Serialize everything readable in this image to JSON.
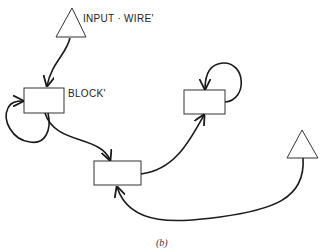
{
  "diagram": {
    "caption": "(b)",
    "nodes": [
      {
        "id": "input-triangle",
        "shape": "triangle",
        "label": "INPUT · WIRE'"
      },
      {
        "id": "block-1",
        "shape": "rectangle",
        "label": "BLOCK'"
      },
      {
        "id": "block-2",
        "shape": "rectangle",
        "label": ""
      },
      {
        "id": "block-3",
        "shape": "rectangle",
        "label": ""
      },
      {
        "id": "right-triangle",
        "shape": "triangle",
        "label": ""
      }
    ],
    "edges": [
      {
        "from": "input-triangle",
        "to": "block-1"
      },
      {
        "from": "block-1",
        "to": "block-1",
        "type": "self-loop"
      },
      {
        "from": "block-1",
        "to": "block-2"
      },
      {
        "from": "block-2",
        "to": "block-3"
      },
      {
        "from": "block-3",
        "to": "block-3",
        "type": "self-loop"
      },
      {
        "from": "right-triangle",
        "to": "block-2"
      }
    ],
    "colors": {
      "stroke": "#1a1a1a",
      "background": "#ffffff"
    }
  }
}
